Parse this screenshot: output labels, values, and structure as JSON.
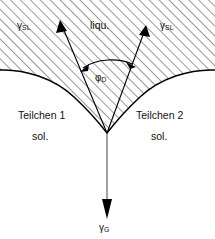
{
  "figure": {
    "width": 215,
    "height": 239,
    "background_color": "#ffffff",
    "line_color": "#000000",
    "hatch_color": "#3a3a3a"
  },
  "regions": {
    "liquid": {
      "label": "liqu.",
      "fill": "hatched-45deg",
      "description": "Hatched liquid region occupying upper area and wedge between particles"
    },
    "particle_left": {
      "name_label": "Teilchen 1",
      "phase_label": "sol.",
      "fill": "white"
    },
    "particle_right": {
      "name_label": "Teilchen 2",
      "phase_label": "sol.",
      "fill": "white"
    }
  },
  "vectors": {
    "gamma_sl_left": {
      "symbol": "γ",
      "subscript": "SL",
      "direction": "up-left",
      "description": "Solid-liquid interfacial tension along left particle surface"
    },
    "gamma_sl_right": {
      "symbol": "γ",
      "subscript": "SL",
      "direction": "up-right",
      "description": "Solid-liquid interfacial tension along right particle surface"
    },
    "gamma_g": {
      "symbol": "γ",
      "subscript": "G",
      "direction": "down",
      "description": "Grain boundary tension pointing downward from the vertex"
    }
  },
  "angle": {
    "symbol": "φ",
    "subscript": "D",
    "description": "Dihedral angle between the two solid-liquid tension vectors",
    "arc_style": "double-headed"
  }
}
